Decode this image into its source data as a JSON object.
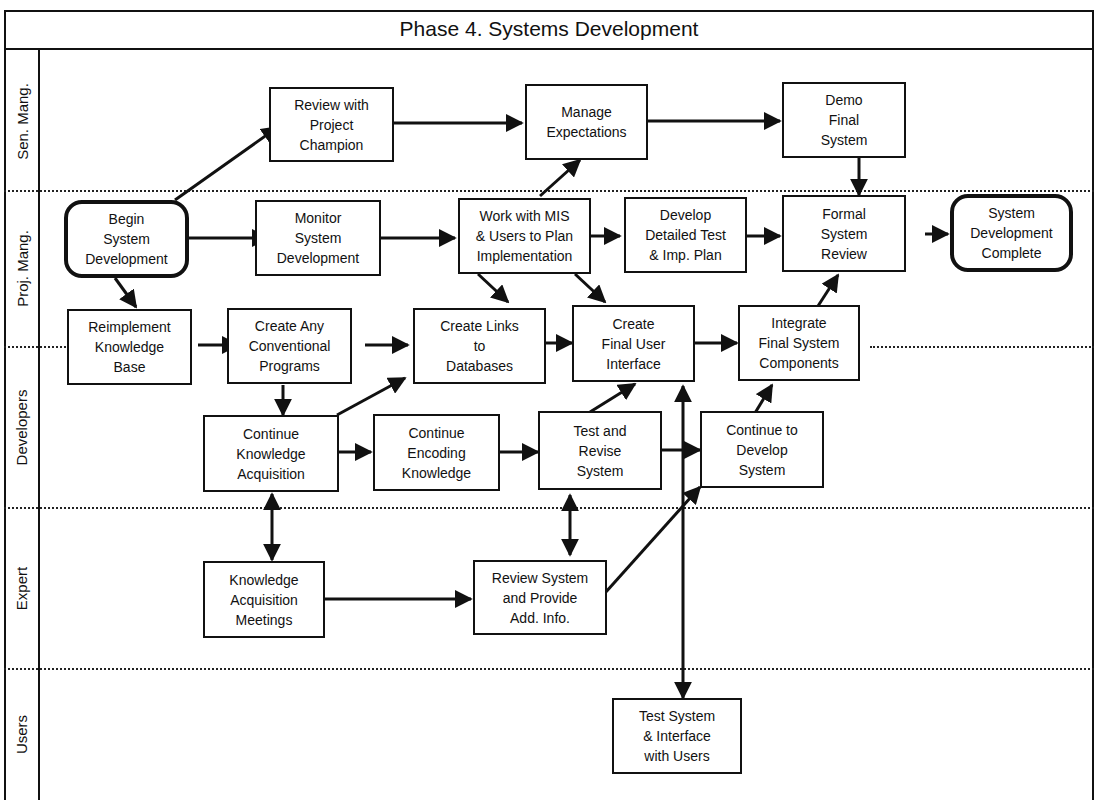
{
  "diagram": {
    "title": "Phase 4. Systems Development",
    "lanes": [
      {
        "id": "sen_mang",
        "label": "Sen. Mang."
      },
      {
        "id": "proj_mang",
        "label": "Proj. Mang."
      },
      {
        "id": "developers",
        "label": "Developers"
      },
      {
        "id": "expert",
        "label": "Expert"
      },
      {
        "id": "users",
        "label": "Users"
      }
    ],
    "nodes": {
      "review_champion": "Review with\nProject\nChampion",
      "manage_expectations": "Manage\nExpectations",
      "demo_final": "Demo\nFinal\nSystem",
      "begin_dev": "Begin\nSystem\nDevelopment",
      "monitor_dev": "Monitor\nSystem\nDevelopment",
      "work_mis": "Work with MIS\n& Users  to Plan\nImplementation",
      "detailed_test": "Develop\nDetailed Test\n& Imp. Plan",
      "formal_review": "Formal\nSystem\nReview",
      "dev_complete": "System\nDevelopment\nComplete",
      "reimplement_kb": "Reimplement\nKnowledge\nBase",
      "conventional_programs": "Create Any\nConventional\nPrograms",
      "links_databases": "Create  Links\nto\nDatabases",
      "final_ui": "Create\nFinal User\nInterface",
      "integrate_components": "Integrate\nFinal System\nComponents",
      "continue_ka": "Continue\nKnowledge\nAcquisition",
      "continue_encoding": "Continue\nEncoding\nKnowledge",
      "test_revise": "Test and\nRevise\nSystem",
      "continue_develop": "Continue to\nDevelop\nSystem",
      "ka_meetings": "Knowledge\nAcquisition\nMeetings",
      "review_provide": "Review  System\nand Provide\nAdd. Info.",
      "test_users": "Test System\n& Interface\nwith Users"
    },
    "edges": [
      [
        "begin_dev",
        "review_champion"
      ],
      [
        "review_champion",
        "manage_expectations"
      ],
      [
        "manage_expectations",
        "demo_final"
      ],
      [
        "work_mis",
        "manage_expectations"
      ],
      [
        "demo_final",
        "formal_review"
      ],
      [
        "begin_dev",
        "monitor_dev"
      ],
      [
        "monitor_dev",
        "work_mis"
      ],
      [
        "work_mis",
        "detailed_test"
      ],
      [
        "detailed_test",
        "formal_review"
      ],
      [
        "formal_review",
        "dev_complete"
      ],
      [
        "begin_dev",
        "reimplement_kb"
      ],
      [
        "work_mis",
        "links_databases"
      ],
      [
        "work_mis",
        "final_ui"
      ],
      [
        "reimplement_kb",
        "conventional_programs"
      ],
      [
        "conventional_programs",
        "links_databases"
      ],
      [
        "links_databases",
        "final_ui"
      ],
      [
        "final_ui",
        "integrate_components"
      ],
      [
        "integrate_components",
        "formal_review"
      ],
      [
        "conventional_programs",
        "continue_ka"
      ],
      [
        "continue_ka",
        "links_databases"
      ],
      [
        "continue_ka",
        "continue_encoding"
      ],
      [
        "continue_encoding",
        "test_revise"
      ],
      [
        "test_revise",
        "final_ui"
      ],
      [
        "test_revise",
        "continue_develop"
      ],
      [
        "continue_develop",
        "integrate_components"
      ],
      [
        "continue_ka",
        "ka_meetings",
        "bidirectional"
      ],
      [
        "ka_meetings",
        "review_provide"
      ],
      [
        "test_revise",
        "review_provide",
        "bidirectional"
      ],
      [
        "review_provide",
        "continue_develop"
      ],
      [
        "final_ui",
        "test_users",
        "bidirectional"
      ]
    ]
  }
}
